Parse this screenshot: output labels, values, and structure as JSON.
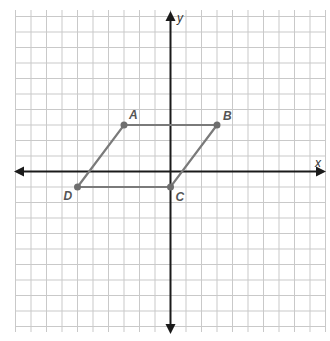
{
  "figure": {
    "type": "coordinate-plane",
    "x_axis_label": "x",
    "y_axis_label": "y",
    "grid_unit": 1,
    "x_range": [
      -10,
      10
    ],
    "y_range": [
      -10,
      10
    ],
    "colors": {
      "grid": "#c9c9c9",
      "axes": "#1a1a1a",
      "shape": "#7a7a7a",
      "points": "#6e6e6e"
    }
  },
  "shape": {
    "name": "parallelogram ABCD",
    "points": [
      {
        "label": "A",
        "x": -3,
        "y": 3
      },
      {
        "label": "B",
        "x": 3,
        "y": 3
      },
      {
        "label": "C",
        "x": 0,
        "y": -1
      },
      {
        "label": "D",
        "x": -6,
        "y": -1
      }
    ]
  }
}
